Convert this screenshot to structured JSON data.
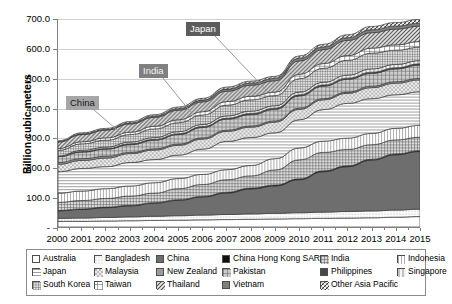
{
  "axis": {
    "ylabel": "Billion cubic meters",
    "yticks": [
      "700.0",
      "600.0",
      "500.0",
      "400.0",
      "300.0",
      "200.0",
      "100.0",
      "-"
    ],
    "ytick_values": [
      700,
      600,
      500,
      400,
      300,
      200,
      100,
      0
    ]
  },
  "callouts": [
    {
      "label": "China",
      "color": "#a6a6a6"
    },
    {
      "label": "India",
      "color": "#808080"
    },
    {
      "label": "Japan",
      "color": "#5c5c5c"
    }
  ],
  "legend": {
    "rows": [
      [
        {
          "label": "Australia",
          "pattern": "blank"
        },
        {
          "label": "Bangladesh",
          "pattern": "dots-light"
        },
        {
          "label": "China",
          "pattern": "solid-dark"
        },
        {
          "label": "China Hong Kong SAR",
          "pattern": "solid-black"
        },
        {
          "label": "India",
          "pattern": "grid-fine"
        },
        {
          "label": "Indonesia",
          "pattern": "vertical"
        }
      ],
      [
        {
          "label": "Japan",
          "pattern": "horizontal"
        },
        {
          "label": "Malaysia",
          "pattern": "checker-light"
        },
        {
          "label": "New Zealand",
          "pattern": "solid-mid"
        },
        {
          "label": "Pakistan",
          "pattern": "grid"
        },
        {
          "label": "Philippines",
          "pattern": "solid-darkgray"
        },
        {
          "label": "Singapore",
          "pattern": "vertical-wide"
        }
      ],
      [
        {
          "label": "South Korea",
          "pattern": "grid-dense"
        },
        {
          "label": "Taiwan",
          "pattern": "cross"
        },
        {
          "label": "Thailand",
          "pattern": "diagonal"
        },
        {
          "label": "Vietnam",
          "pattern": "solid-gray"
        },
        {
          "label": "Other Asia Pacific",
          "pattern": "diagonal-cross"
        }
      ]
    ]
  },
  "chart_data": {
    "type": "area",
    "title": "",
    "xlabel": "",
    "ylabel": "Billion cubic meters",
    "ylim": [
      0,
      700
    ],
    "grid": true,
    "stacked": true,
    "legend_position": "bottom",
    "categories": [
      "2000",
      "2001",
      "2002",
      "2003",
      "2004",
      "2005",
      "2006",
      "2007",
      "2008",
      "2009",
      "2010",
      "2011",
      "2012",
      "2013",
      "2014",
      "2015"
    ],
    "series": [
      {
        "name": "Australia",
        "pattern": "blank",
        "values": [
          19,
          19,
          20,
          21,
          22,
          23,
          24,
          25,
          26,
          27,
          28,
          29,
          30,
          31,
          33,
          35
        ]
      },
      {
        "name": "Bangladesh",
        "pattern": "dots-light",
        "values": [
          10,
          11,
          12,
          13,
          14,
          15,
          16,
          17,
          18,
          19,
          20,
          21,
          22,
          23,
          24,
          25
        ]
      },
      {
        "name": "China",
        "pattern": "solid-dark",
        "values": [
          25,
          29,
          33,
          37,
          44,
          52,
          61,
          72,
          84,
          92,
          111,
          136,
          151,
          171,
          186,
          194
        ]
      },
      {
        "name": "China Hong Kong SAR",
        "pattern": "solid-black",
        "values": [
          2,
          2,
          2,
          2,
          2,
          2,
          2,
          3,
          3,
          3,
          3,
          3,
          3,
          3,
          3,
          3
        ]
      },
      {
        "name": "India",
        "pattern": "grid-fine",
        "values": [
          27,
          28,
          29,
          31,
          32,
          37,
          40,
          42,
          41,
          51,
          64,
          62,
          55,
          49,
          47,
          45
        ]
      },
      {
        "name": "Indonesia",
        "pattern": "vertical",
        "values": [
          31,
          32,
          33,
          34,
          35,
          34,
          34,
          34,
          35,
          38,
          40,
          38,
          38,
          38,
          39,
          40
        ]
      },
      {
        "name": "Japan",
        "pattern": "horizontal",
        "values": [
          72,
          76,
          74,
          79,
          78,
          79,
          85,
          95,
          94,
          87,
          95,
          106,
          117,
          117,
          113,
          113
        ]
      },
      {
        "name": "Malaysia",
        "pattern": "checker-light",
        "values": [
          25,
          27,
          29,
          30,
          32,
          33,
          34,
          34,
          35,
          36,
          35,
          33,
          34,
          37,
          39,
          40
        ]
      },
      {
        "name": "New Zealand",
        "pattern": "solid-mid",
        "values": [
          6,
          6,
          6,
          4,
          4,
          4,
          4,
          4,
          4,
          4,
          4,
          4,
          4,
          5,
          5,
          5
        ]
      },
      {
        "name": "Pakistan",
        "pattern": "grid",
        "values": [
          20,
          22,
          24,
          26,
          29,
          32,
          35,
          37,
          38,
          39,
          41,
          42,
          43,
          43,
          43,
          45
        ]
      },
      {
        "name": "Philippines",
        "pattern": "solid-darkgray",
        "values": [
          0,
          2,
          2,
          3,
          3,
          3,
          3,
          3,
          4,
          4,
          4,
          4,
          4,
          4,
          4,
          4
        ]
      },
      {
        "name": "Singapore",
        "pattern": "vertical-wide",
        "values": [
          2,
          4,
          5,
          6,
          6,
          7,
          7,
          8,
          8,
          8,
          9,
          9,
          10,
          11,
          11,
          11
        ]
      },
      {
        "name": "South Korea",
        "pattern": "grid-dense",
        "values": [
          19,
          22,
          23,
          25,
          29,
          30,
          32,
          36,
          38,
          34,
          45,
          47,
          50,
          53,
          48,
          45
        ]
      },
      {
        "name": "Taiwan",
        "pattern": "cross",
        "values": [
          6,
          7,
          8,
          8,
          9,
          10,
          11,
          12,
          12,
          12,
          15,
          16,
          16,
          17,
          18,
          19
        ]
      },
      {
        "name": "Thailand",
        "pattern": "diagonal",
        "values": [
          22,
          24,
          26,
          28,
          30,
          32,
          33,
          35,
          37,
          38,
          45,
          47,
          51,
          52,
          53,
          52
        ]
      },
      {
        "name": "Vietnam",
        "pattern": "solid-gray",
        "values": [
          1,
          2,
          2,
          3,
          4,
          5,
          6,
          7,
          7,
          8,
          9,
          9,
          9,
          10,
          10,
          10
        ]
      },
      {
        "name": "Other Asia Pacific",
        "pattern": "diagonal-cross",
        "values": [
          3,
          4,
          4,
          5,
          5,
          6,
          6,
          7,
          7,
          7,
          8,
          9,
          10,
          11,
          12,
          13
        ]
      }
    ],
    "total_2000": 290,
    "total_2015": 699
  }
}
